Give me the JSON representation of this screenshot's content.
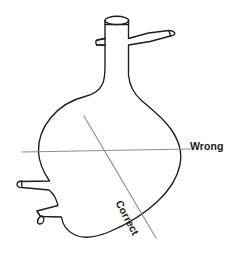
{
  "diagram": {
    "type": "technical-line-illustration",
    "background_color": "#ffffff",
    "outline_color": "#1d1d1d",
    "guide_line_color": "#8c8c8c",
    "labels": {
      "wrong": "Wrong",
      "correct": "Correct"
    },
    "annotation_lines": [
      {
        "name": "wrong-axis-line",
        "label": "Wrong",
        "orientation": "horizontal",
        "color": "#8c8c8c",
        "from": [
          22,
          152
        ],
        "to": [
          190,
          149
        ]
      },
      {
        "name": "correct-axis-line",
        "label": "Correct",
        "orientation": "diagonal",
        "color": "#8c8c8c",
        "from": [
          84,
          116
        ],
        "to": [
          156,
          238
        ]
      }
    ],
    "vessel_parts": [
      {
        "name": "top-neck",
        "description": "vertical open neck with elliptical rim"
      },
      {
        "name": "left-upper-side-arm",
        "description": "short tube angled left"
      },
      {
        "name": "right-upper-side-arm",
        "description": "short tube angled right"
      },
      {
        "name": "flask-body",
        "description": "rounded asymmetric bulb"
      },
      {
        "name": "left-lower-side-arm",
        "description": "horizontal tube with oval opening"
      },
      {
        "name": "bottom-left-side-arm",
        "description": "tube angled down-left with oval opening"
      }
    ]
  }
}
